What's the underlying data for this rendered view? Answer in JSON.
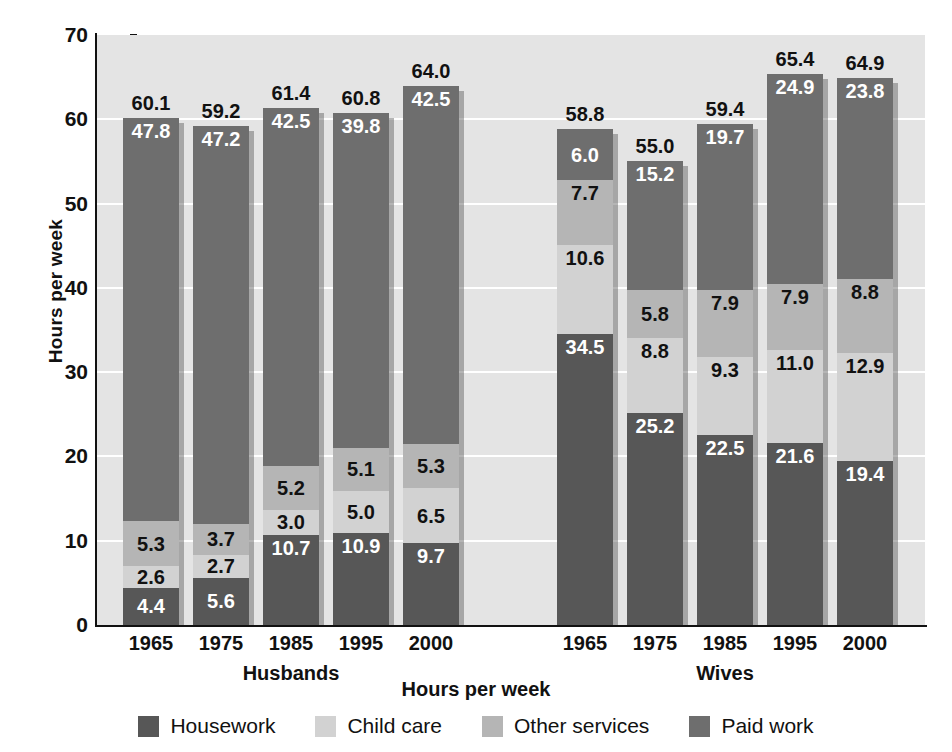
{
  "chart_data": {
    "type": "bar",
    "subtype": "stacked-grouped",
    "title": "",
    "xlabel": "Hours per week",
    "ylabel": "Hours per week",
    "ylim": [
      0,
      70
    ],
    "ytick_step": 10,
    "yticks": [
      "0",
      "10",
      "20",
      "30",
      "40",
      "50",
      "60",
      "70"
    ],
    "grid": "horizontal-white",
    "legend_position": "bottom",
    "categories": [
      "1965",
      "1975",
      "1985",
      "1995",
      "2000"
    ],
    "groups": [
      "Husbands",
      "Wives"
    ],
    "series": [
      {
        "name": "Housework",
        "color": "#575757",
        "label_color": "#ffffff",
        "values_husbands": [
          4.4,
          5.6,
          10.7,
          10.9,
          9.7
        ],
        "values_wives": [
          34.5,
          25.2,
          22.5,
          21.6,
          19.4
        ]
      },
      {
        "name": "Child care",
        "color": "#d2d2d2",
        "label_color": "#111111",
        "values_husbands": [
          2.6,
          2.7,
          3.0,
          5.0,
          6.5
        ],
        "values_wives": [
          10.6,
          8.8,
          9.3,
          11.0,
          12.9
        ]
      },
      {
        "name": "Other services",
        "color": "#b5b5b5",
        "label_color": "#111111",
        "values_husbands": [
          5.3,
          3.7,
          5.2,
          5.1,
          5.3
        ],
        "values_wives": [
          7.7,
          5.8,
          7.9,
          7.9,
          8.8
        ]
      },
      {
        "name": "Paid work",
        "color": "#6e6e6e",
        "label_color": "#ffffff",
        "values_husbands": [
          47.8,
          47.2,
          42.5,
          39.8,
          42.5
        ],
        "values_wives": [
          6.0,
          15.2,
          19.7,
          24.9,
          23.8
        ]
      }
    ],
    "totals_husbands": [
      60.1,
      59.2,
      61.4,
      60.8,
      64.0
    ],
    "totals_wives": [
      58.8,
      55.0,
      59.4,
      65.4,
      64.9
    ]
  },
  "axes": {
    "y_title": "Hours per week",
    "x_title": "Hours per week",
    "y_ticks": [
      "70",
      "60",
      "50",
      "40",
      "30",
      "20",
      "10",
      "0"
    ]
  },
  "groups": [
    {
      "label": "Husbands",
      "ticks": [
        "1965",
        "1975",
        "1985",
        "1995",
        "2000"
      ]
    },
    {
      "label": "Wives",
      "ticks": [
        "1965",
        "1975",
        "1985",
        "1995",
        "2000"
      ]
    }
  ],
  "legend": {
    "items": [
      {
        "label": "Housework",
        "color": "#575757"
      },
      {
        "label": "Child care",
        "color": "#d2d2d2"
      },
      {
        "label": "Other services",
        "color": "#b5b5b5"
      },
      {
        "label": "Paid work",
        "color": "#6e6e6e"
      }
    ]
  },
  "colors": {
    "plot_background": "#e4e4e4",
    "page_background": "#ffffff",
    "gridline": "#ffffff",
    "axis": "#111111",
    "text": "#111111"
  }
}
